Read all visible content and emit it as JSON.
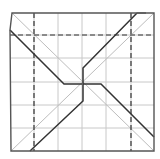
{
  "diagram": {
    "type": "origami-crease-pattern",
    "canvas": {
      "width": 160,
      "height": 159
    },
    "colors": {
      "background": "#ffffff",
      "outline": "#555555",
      "grid": "#c8c8c8",
      "diagonal": "#bdbdbd",
      "dashed": "#333333",
      "bold": "#333333"
    },
    "square": {
      "x0": 11,
      "y0": 13,
      "x1": 154,
      "y1": 151
    },
    "outline_points": "12,13 154,13 154,151 11,151 10,30",
    "grid_x": [
      34,
      58,
      82,
      106,
      131
    ],
    "grid_y": [
      35,
      58,
      82,
      105,
      128
    ],
    "diagonals": [
      {
        "x1": 12,
        "y1": 13,
        "x2": 154,
        "y2": 151
      },
      {
        "x1": 154,
        "y1": 13,
        "x2": 11,
        "y2": 151
      }
    ],
    "dashed_lines": [
      {
        "x1": 34,
        "y1": 13,
        "x2": 34,
        "y2": 151
      },
      {
        "x1": 131,
        "y1": 13,
        "x2": 131,
        "y2": 151
      },
      {
        "x1": 10,
        "y1": 35,
        "x2": 154,
        "y2": 35
      }
    ],
    "bold_paths": [
      "10,30 64,84 82,84",
      "137,13 83,68 83,84",
      "83,84 101,84 154,137",
      "83,84 83,101 30,151"
    ],
    "cap_top_right": "137,13 146,13"
  }
}
